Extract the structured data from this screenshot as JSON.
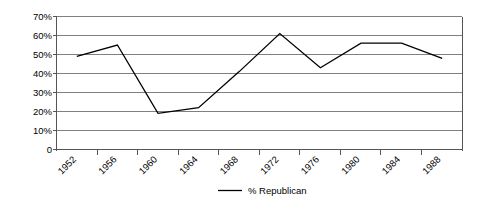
{
  "chart_data": {
    "type": "line",
    "title": "",
    "xlabel": "",
    "ylabel": "",
    "categories": [
      "1952",
      "1956",
      "1960",
      "1964",
      "1968",
      "1972",
      "1976",
      "1980",
      "1984",
      "1988"
    ],
    "series": [
      {
        "name": "% Republican",
        "values": [
          49,
          55,
          19,
          22,
          41,
          61,
          43,
          56,
          56,
          48
        ],
        "color": "#000000"
      }
    ],
    "ylim": [
      0,
      70
    ],
    "ytick_values": [
      0,
      10,
      20,
      30,
      40,
      50,
      60,
      70
    ],
    "ytick_labels": [
      "0",
      "10%",
      "20%",
      "30%",
      "40%",
      "50%",
      "60%",
      "70%"
    ],
    "grid": true,
    "grid_axis": "y",
    "legend_position": "bottom",
    "legend_entries": [
      "% Republican"
    ],
    "xtick_rotation": -45,
    "marker": "none"
  }
}
